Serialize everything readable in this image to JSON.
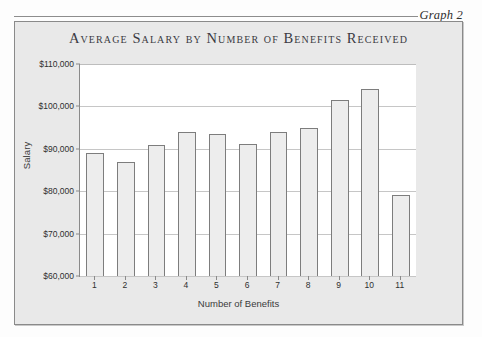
{
  "caption": {
    "label": "Graph 2"
  },
  "chart_data": {
    "type": "bar",
    "title": "Average Salary by Number of Benefits Received",
    "xlabel": "Number of Benefits",
    "ylabel": "Salary",
    "categories": [
      "1",
      "2",
      "3",
      "4",
      "5",
      "6",
      "7",
      "8",
      "9",
      "10",
      "11"
    ],
    "values": [
      89000,
      87000,
      91000,
      94000,
      93500,
      91200,
      94000,
      94800,
      101500,
      104000,
      79000
    ],
    "ylim": [
      60000,
      110000
    ],
    "ytick_values": [
      60000,
      70000,
      80000,
      90000,
      100000,
      110000
    ],
    "ytick_labels": [
      "$60,000",
      "$70,000",
      "$80,000",
      "$90,000",
      "$100,000",
      "$110,000"
    ],
    "grid": true,
    "legend": "none",
    "bar_fill": "#ededed",
    "bar_border": "#7d7d7d",
    "plot_background": "#ffffff",
    "frame_background": "#e9e9e9"
  }
}
